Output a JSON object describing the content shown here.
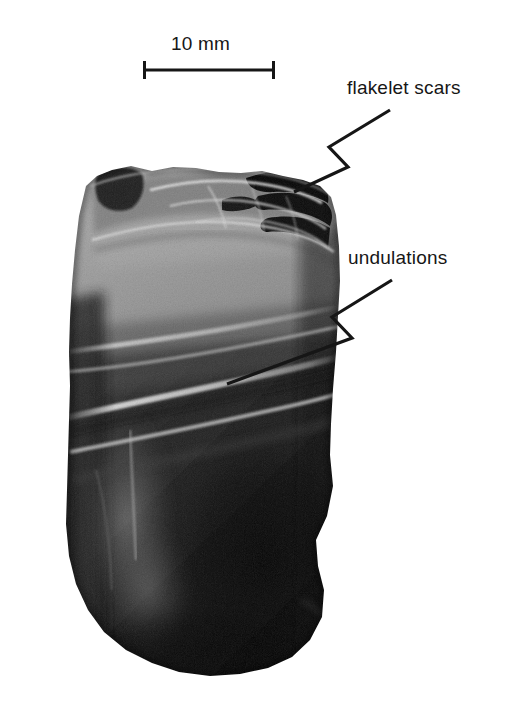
{
  "figure": {
    "type": "photograph",
    "background_color": "#ffffff",
    "ink_color": "#161616"
  },
  "scale_bar": {
    "label": "10 mm",
    "x_start": 143,
    "x_end": 275,
    "y": 70,
    "tick_height": 18,
    "line_width": 3
  },
  "annotations": [
    {
      "id": "flakelet-scars",
      "label": "flakelet scars",
      "text_x": 347,
      "text_y": 78,
      "leader_points": "390,110 329,147 348,167 294,192",
      "target_x": 294,
      "target_y": 192
    },
    {
      "id": "undulations",
      "label": "undulations",
      "text_x": 348,
      "text_y": 248,
      "leader_points": "392,280 332,317 352,338 227,384",
      "target_x": 227,
      "target_y": 384
    }
  ],
  "specimen": {
    "name": "stone-flake",
    "outline": "86,186 97,176 112,170 131,166 152,171 173,167 196,168 219,172 241,173 262,171 283,176 303,180 320,186 331,197 336,215 339,246 340,281 338,316 336,352 333,389 331,424 330,455 333,486 327,516 316,540 318,566 324,590 322,617 310,640 292,657 268,668 240,674 210,676 179,672 152,663 126,650 104,632 88,610 76,584 69,556 66,524 67,490 68,455 69,420 70,386 69,352 70,318 72,284 75,250 79,216",
    "tones": {
      "upper_light": "#9a9a9a",
      "upper_mid": "#7e7e7e",
      "lower_dark": "#1f1f1f",
      "deep_shadow": "#0a0a0a",
      "highlight": "#d8d8d8"
    },
    "features": {
      "flakelet_scar_zone": "upper right crest, deep black pockets with bright ridges",
      "undulation_ridges": "bright arcing ripple bands crossing mid-body",
      "texture": "coarse granular stipple"
    }
  }
}
